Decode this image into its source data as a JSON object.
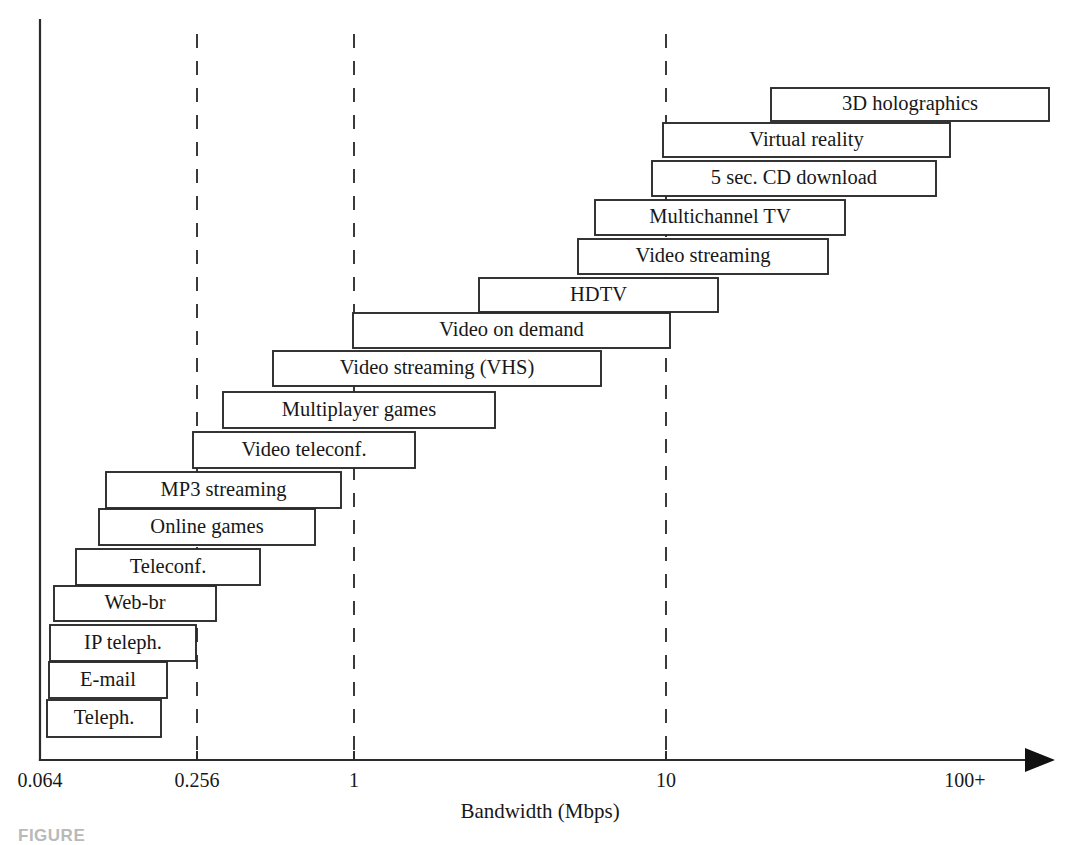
{
  "figure": {
    "caption": "FIGURE",
    "background_color": "#ffffff",
    "bar_stroke_color": "#2b2b2b",
    "bar_fill_color": "#ffffff",
    "axis_color": "#2b2b2b",
    "text_color": "#171717"
  },
  "chart_data": {
    "type": "bar",
    "orientation": "horizontal",
    "title": "",
    "subtitle": "",
    "xlabel": "Bandwidth (Mbps)",
    "ylabel": "",
    "x_scale": "logarithmic",
    "grid": true,
    "grid_axis": "x",
    "grid_style": "dashed",
    "legend": "none",
    "axis_arrow": true,
    "xtick_labels": [
      "0.064",
      "0.256",
      "1",
      "10",
      "100+"
    ],
    "xtick_values": [
      0.064,
      0.256,
      1,
      10,
      100
    ],
    "xlim": [
      0.064,
      100
    ],
    "categories": [
      "3D holographics",
      "Virtual reality",
      "5 sec. CD download",
      "Multichannel TV",
      "Video streaming",
      "HDTV",
      "Video on demand",
      "Video streaming (VHS)",
      "Multiplayer games",
      "Video teleconf.",
      "MP3 streaming",
      "Online games",
      "Teleconf.",
      "Web-br",
      "IP teleph.",
      "E-mail",
      "Teleph."
    ],
    "bars": [
      {
        "label": "3D holographics",
        "x_start_px": 771,
        "x_end_px": 1049,
        "y_top_px": 88,
        "y_bottom_px": 121,
        "bandwidth_start_mbps": 27,
        "bandwidth_end_mbps": 300
      },
      {
        "label": "Virtual reality",
        "x_start_px": 663,
        "x_end_px": 950,
        "y_top_px": 123,
        "y_bottom_px": 157,
        "bandwidth_start_mbps": 10,
        "bandwidth_end_mbps": 100
      },
      {
        "label": "5 sec. CD download",
        "x_start_px": 652,
        "x_end_px": 936,
        "y_top_px": 161,
        "y_bottom_px": 196,
        "bandwidth_start_mbps": 9.1,
        "bandwidth_end_mbps": 90
      },
      {
        "label": "Multichannel TV",
        "x_start_px": 595,
        "x_end_px": 845,
        "y_top_px": 200,
        "y_bottom_px": 235,
        "bandwidth_start_mbps": 5.4,
        "bandwidth_end_mbps": 36
      },
      {
        "label": "Video streaming",
        "x_start_px": 578,
        "x_end_px": 828,
        "y_top_px": 239,
        "y_bottom_px": 274,
        "bandwidth_start_mbps": 4.6,
        "bandwidth_end_mbps": 31
      },
      {
        "label": "HDTV",
        "x_start_px": 479,
        "x_end_px": 718,
        "y_top_px": 278,
        "y_bottom_px": 312,
        "bandwidth_start_mbps": 2.2,
        "bandwidth_end_mbps": 13
      },
      {
        "label": "Video on demand",
        "x_start_px": 353,
        "x_end_px": 670,
        "y_top_px": 313,
        "y_bottom_px": 348,
        "bandwidth_start_mbps": 1.0,
        "bandwidth_end_mbps": 10
      },
      {
        "label": "Video streaming (VHS)",
        "x_start_px": 273,
        "x_end_px": 601,
        "y_top_px": 351,
        "y_bottom_px": 386,
        "bandwidth_start_mbps": 0.53,
        "bandwidth_end_mbps": 5.8
      },
      {
        "label": "Multiplayer games",
        "x_start_px": 223,
        "x_end_px": 495,
        "y_top_px": 392,
        "y_bottom_px": 428,
        "bandwidth_start_mbps": 0.35,
        "bandwidth_end_mbps": 2.4
      },
      {
        "label": "Video teleconf.",
        "x_start_px": 193,
        "x_end_px": 415,
        "y_top_px": 432,
        "y_bottom_px": 468,
        "bandwidth_start_mbps": 0.25,
        "bandwidth_end_mbps": 1.5
      },
      {
        "label": "MP3 streaming",
        "x_start_px": 106,
        "x_end_px": 341,
        "y_top_px": 472,
        "y_bottom_px": 508,
        "bandwidth_start_mbps": 0.105,
        "bandwidth_end_mbps": 0.91
      },
      {
        "label": "Online games",
        "x_start_px": 99,
        "x_end_px": 315,
        "y_top_px": 509,
        "y_bottom_px": 545,
        "bandwidth_start_mbps": 0.098,
        "bandwidth_end_mbps": 0.76
      },
      {
        "label": "Teleconf.",
        "x_start_px": 76,
        "x_end_px": 260,
        "y_top_px": 549,
        "y_bottom_px": 585,
        "bandwidth_start_mbps": 0.082,
        "bandwidth_end_mbps": 0.5
      },
      {
        "label": "Web-br",
        "x_start_px": 54,
        "x_end_px": 216,
        "y_top_px": 586,
        "y_bottom_px": 621,
        "bandwidth_start_mbps": 0.069,
        "bandwidth_end_mbps": 0.35
      },
      {
        "label": "IP teleph.",
        "x_start_px": 50,
        "x_end_px": 196,
        "y_top_px": 625,
        "y_bottom_px": 661,
        "bandwidth_start_mbps": 0.066,
        "bandwidth_end_mbps": 0.28
      },
      {
        "label": "E-mail",
        "x_start_px": 49,
        "x_end_px": 167,
        "y_top_px": 662,
        "y_bottom_px": 698,
        "bandwidth_start_mbps": 0.065,
        "bandwidth_end_mbps": 0.19
      },
      {
        "label": "Teleph.",
        "x_start_px": 47,
        "x_end_px": 161,
        "y_top_px": 700,
        "y_bottom_px": 737,
        "bandwidth_start_mbps": 0.065,
        "bandwidth_end_mbps": 0.18
      }
    ],
    "gridlines_px": [
      197,
      354,
      666
    ],
    "gridline_labels": [
      "0.256",
      "1",
      "10"
    ],
    "axis_geometry": {
      "y_axis_x_px": 40,
      "y_axis_top_px": 20,
      "x_axis_y_px": 760,
      "x_axis_left_px": 40,
      "x_axis_right_px": 1055,
      "tick_px": [
        40,
        197,
        354,
        666
      ],
      "label_px": [
        40,
        197,
        354,
        666,
        965
      ],
      "tick_label_y_px": 787,
      "axis_title_x_px": 540,
      "axis_title_y_px": 818
    }
  }
}
